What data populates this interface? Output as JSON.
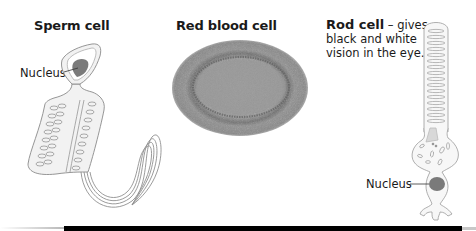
{
  "diagram": {
    "cells": [
      {
        "name": "Sperm cell",
        "labels": [
          "Nucleus"
        ]
      },
      {
        "name": "Red blood cell",
        "labels": []
      },
      {
        "name": "Rod cell",
        "description": " – gives black and white vision in the eye.",
        "labels": [
          "Nucleus"
        ]
      }
    ]
  },
  "colors": {
    "outline": "#8a8a8a",
    "cell_fill": "#f2f2f2",
    "nucleus": "#7a7a7a",
    "rbc_fill": "#8c8c8c",
    "bottom_bar": "#000000"
  }
}
